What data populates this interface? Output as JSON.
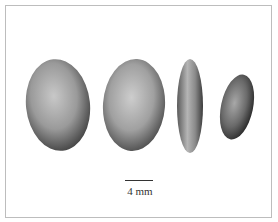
{
  "figure": {
    "scale_label": "4 mm",
    "seeds": [
      {
        "view": "face",
        "color": "#8a8a8a"
      },
      {
        "view": "face",
        "color": "#8f8f8f"
      },
      {
        "view": "edge",
        "color": "#7d7d7d"
      },
      {
        "view": "oblique",
        "color": "#6f6f6f"
      }
    ]
  }
}
